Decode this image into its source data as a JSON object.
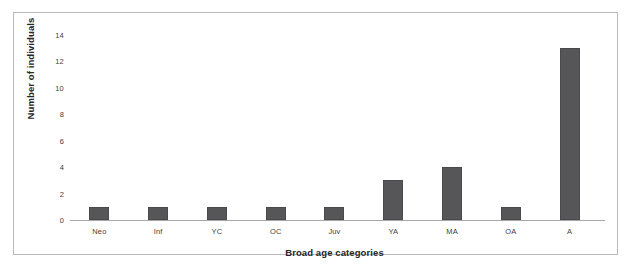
{
  "chart_data": {
    "type": "bar",
    "title": "",
    "xlabel": "Broad age categories",
    "ylabel": "Number of individuals",
    "categories": [
      "Neo",
      "Inf",
      "YC",
      "OC",
      "Juv",
      "YA",
      "MA",
      "OA",
      "A"
    ],
    "values": [
      1,
      1,
      1,
      1,
      1,
      3,
      4,
      1,
      13
    ],
    "ylim": [
      0,
      14
    ],
    "yticks": [
      0,
      2,
      4,
      6,
      8,
      10,
      12,
      14
    ],
    "ytick_labels": [
      "0",
      "2",
      "4",
      "6",
      "8",
      "10",
      "12",
      "14"
    ],
    "grid": false,
    "legend": false,
    "legend_position": "none",
    "bar_color": "#565659",
    "axis_color": "#a6a6a6",
    "frame_color": "#b9b9b9",
    "text_color": "#404040"
  }
}
